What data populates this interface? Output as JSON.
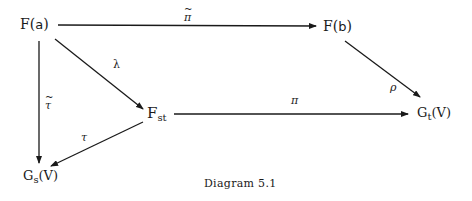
{
  "nodes": {
    "Fa": {
      "base": "F(",
      "arg": "a",
      "close": ")"
    },
    "Fb": {
      "base": "F(",
      "arg": "b",
      "close": ")"
    },
    "Fst": {
      "base": "F",
      "sub": "st"
    },
    "Gt": {
      "base": "G",
      "sub": "t",
      "rest": "(V)"
    },
    "Gs": {
      "base": "G",
      "sub": "s",
      "rest": "(V)"
    }
  },
  "edges": {
    "pi_tilde": {
      "label": "π",
      "from": "F(a)",
      "to": "F(b)",
      "tilde": true
    },
    "rho": {
      "label": "ρ",
      "from": "F(b)",
      "to": "G_t(V)"
    },
    "lambda": {
      "label": "λ",
      "from": "F(a)",
      "to": "F_st"
    },
    "pi": {
      "label": "π",
      "from": "F_st",
      "to": "G_t(V)"
    },
    "tau_tilde": {
      "label": "τ",
      "from": "F(a)",
      "to": "G_s(V)",
      "tilde": true
    },
    "tau": {
      "label": "τ",
      "from": "F_st",
      "to": "G_s(V)"
    }
  },
  "caption": "Diagram 5.1"
}
